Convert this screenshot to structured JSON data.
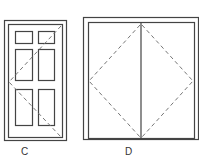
{
  "figures": [
    {
      "id": "door-c",
      "label": "C",
      "type": "single six-panel door with swing indication"
    },
    {
      "id": "door-d",
      "label": "D",
      "type": "double door with swing indication"
    }
  ],
  "colors": {
    "line": "#444444",
    "dash": "#777777",
    "background": "#ffffff"
  }
}
